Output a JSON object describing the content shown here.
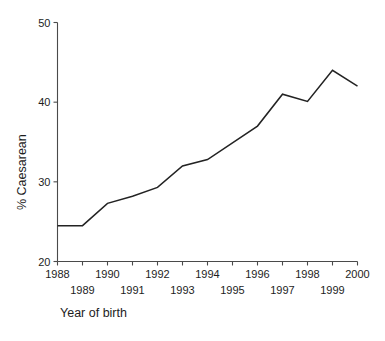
{
  "chart_data": {
    "type": "line",
    "title": "",
    "xlabel": "Year of birth",
    "ylabel": "% Caesarean",
    "xlim": [
      1988,
      2000
    ],
    "ylim": [
      20,
      50
    ],
    "grid": false,
    "legend": "none",
    "x": [
      1988,
      1989,
      1990,
      1991,
      1992,
      1993,
      1994,
      1995,
      1996,
      1997,
      1998,
      1999,
      2000
    ],
    "series": [
      {
        "name": "% Caesarean",
        "values": [
          24.5,
          24.5,
          27.3,
          28.2,
          29.3,
          32.0,
          32.8,
          34.9,
          37.0,
          41.0,
          40.1,
          44.0,
          42.0
        ]
      }
    ],
    "y_ticks": [
      20,
      30,
      40,
      50
    ],
    "y_tick_labels": [
      "20",
      "30",
      "40",
      "50"
    ],
    "x_ticks": [
      1988,
      1989,
      1990,
      1991,
      1992,
      1993,
      1994,
      1995,
      1996,
      1997,
      1998,
      1999,
      2000
    ],
    "x_tick_labels_upper": [
      "1988",
      "1990",
      "1992",
      "1994",
      "1996",
      "1998",
      "2000"
    ],
    "x_tick_labels_lower": [
      "1989",
      "1991",
      "1993",
      "1995",
      "1997",
      "1999"
    ],
    "line_color": "#232323",
    "axis_color": "#4a4a4a",
    "background_color": "#ffffff"
  }
}
